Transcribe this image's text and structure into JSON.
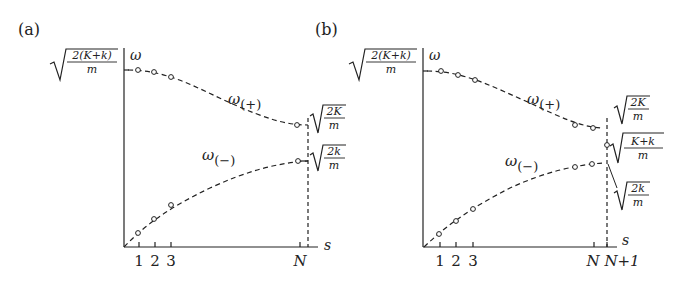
{
  "panels": [
    {
      "label": "(a)",
      "y_axis_label": "ω",
      "x_axis_label": "s",
      "y_top_label": {
        "num": "2(K+k)",
        "den": "m"
      },
      "upper_branch_label": {
        "base": "ω",
        "sub": "(+)"
      },
      "lower_branch_label": {
        "base": "ω",
        "sub": "(−)"
      },
      "right_labels": [
        {
          "num": "2K",
          "den": "m"
        },
        {
          "num": "2k",
          "den": "m"
        }
      ],
      "x_ticks": [
        "1",
        "2",
        "3",
        "N"
      ]
    },
    {
      "label": "(b)",
      "y_axis_label": "ω",
      "x_axis_label": "s",
      "y_top_label": {
        "num": "2(K+k)",
        "den": "m"
      },
      "upper_branch_label": {
        "base": "ω",
        "sub": "(+)"
      },
      "lower_branch_label": {
        "base": "ω",
        "sub": "(−)"
      },
      "right_labels": [
        {
          "num": "2K",
          "den": "m"
        },
        {
          "num": "K+k",
          "den": "m"
        },
        {
          "num": "2k",
          "den": "m"
        }
      ],
      "x_ticks": [
        "1",
        "2",
        "3",
        "N",
        "N+1"
      ]
    }
  ],
  "colors": {
    "ink": "#222222",
    "background": "#ffffff"
  }
}
